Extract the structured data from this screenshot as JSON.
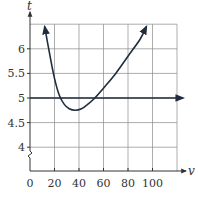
{
  "chart_data": {
    "type": "line",
    "title": "",
    "xlabel": "v",
    "ylabel": "t",
    "xlim": [
      0,
      120
    ],
    "ylim": [
      3.5,
      6.5
    ],
    "y_axis_break": true,
    "grid": true,
    "x_ticks": [
      0,
      20,
      40,
      60,
      80,
      100
    ],
    "x_tick_labels": [
      "0",
      "20",
      "40",
      "60",
      "80",
      "100"
    ],
    "y_ticks": [
      4,
      4.5,
      5,
      5.5,
      6
    ],
    "y_tick_labels": [
      "4",
      "4.5",
      "5",
      "5.5",
      "6"
    ],
    "series": [
      {
        "name": "curve",
        "x": [
          12,
          16,
          20,
          24,
          28,
          32,
          37,
          42,
          47,
          53,
          60,
          70,
          80,
          90,
          95
        ],
        "values": [
          6.45,
          5.9,
          5.4,
          5.05,
          4.87,
          4.78,
          4.75,
          4.78,
          4.87,
          5.0,
          5.2,
          5.5,
          5.85,
          6.2,
          6.45
        ],
        "arrows": "both"
      },
      {
        "name": "t = 5 line",
        "x": [
          0,
          125
        ],
        "values": [
          5,
          5
        ],
        "arrows": "end"
      }
    ]
  },
  "labels": {
    "x_axis": "v",
    "y_axis": "t"
  }
}
